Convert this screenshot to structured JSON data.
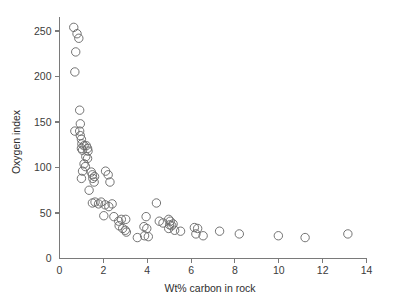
{
  "figure": {
    "background": "#ffffff",
    "marker_color": "#6b6b6b",
    "axis_color": "#7a7a7a",
    "text_color": "#2e2e2e"
  },
  "chart_data": {
    "type": "scatter",
    "title": "",
    "xlabel": "Wt% carbon in rock",
    "ylabel": "Oxygen index",
    "xlim": [
      0,
      14
    ],
    "ylim": [
      0,
      270
    ],
    "xticks": [
      0,
      2,
      4,
      6,
      8,
      10,
      12,
      14
    ],
    "xtick_labels": [
      "0",
      "2",
      "4",
      "6",
      "8",
      "10",
      "12",
      "14"
    ],
    "yticks": [
      0,
      50,
      100,
      150,
      200,
      250
    ],
    "ytick_labels": [
      "0",
      "50",
      "100",
      "150",
      "200",
      "250"
    ],
    "grid": false,
    "legend": null,
    "marker": "open-circle",
    "marker_size": 4.2,
    "series": [
      {
        "name": "samples",
        "points": [
          [
            0.65,
            254
          ],
          [
            0.8,
            247
          ],
          [
            0.88,
            242
          ],
          [
            0.74,
            227
          ],
          [
            0.7,
            205
          ],
          [
            0.92,
            163
          ],
          [
            0.7,
            140
          ],
          [
            0.95,
            148
          ],
          [
            0.92,
            140
          ],
          [
            0.95,
            135
          ],
          [
            1.0,
            131
          ],
          [
            1.02,
            126
          ],
          [
            1.0,
            121
          ],
          [
            1.05,
            119
          ],
          [
            1.12,
            124
          ],
          [
            1.22,
            124
          ],
          [
            1.28,
            121
          ],
          [
            1.3,
            118
          ],
          [
            1.2,
            112
          ],
          [
            1.28,
            110
          ],
          [
            1.12,
            104
          ],
          [
            1.18,
            101
          ],
          [
            1.05,
            96
          ],
          [
            1.0,
            88
          ],
          [
            1.45,
            95
          ],
          [
            1.5,
            92
          ],
          [
            1.52,
            88
          ],
          [
            1.6,
            90
          ],
          [
            1.58,
            84
          ],
          [
            1.35,
            75
          ],
          [
            2.1,
            96
          ],
          [
            2.22,
            92
          ],
          [
            2.3,
            84
          ],
          [
            1.5,
            61
          ],
          [
            1.62,
            62
          ],
          [
            1.78,
            60
          ],
          [
            1.9,
            62
          ],
          [
            2.08,
            59
          ],
          [
            2.25,
            57
          ],
          [
            2.4,
            60
          ],
          [
            2.02,
            47
          ],
          [
            2.48,
            46
          ],
          [
            2.7,
            41
          ],
          [
            2.82,
            43
          ],
          [
            3.02,
            43
          ],
          [
            2.72,
            36
          ],
          [
            2.88,
            33
          ],
          [
            3.0,
            31
          ],
          [
            3.05,
            29
          ],
          [
            3.55,
            23
          ],
          [
            3.95,
            46
          ],
          [
            3.85,
            35
          ],
          [
            3.98,
            33
          ],
          [
            3.88,
            25
          ],
          [
            4.05,
            24
          ],
          [
            4.42,
            61
          ],
          [
            4.55,
            41
          ],
          [
            4.72,
            39
          ],
          [
            4.98,
            43
          ],
          [
            5.05,
            41
          ],
          [
            5.02,
            37
          ],
          [
            5.12,
            36
          ],
          [
            5.18,
            38
          ],
          [
            4.98,
            33
          ],
          [
            5.25,
            31
          ],
          [
            5.52,
            30
          ],
          [
            6.15,
            34
          ],
          [
            6.3,
            33
          ],
          [
            6.22,
            27
          ],
          [
            6.55,
            25
          ],
          [
            7.3,
            30
          ],
          [
            8.2,
            27
          ],
          [
            9.98,
            25
          ],
          [
            11.2,
            23
          ],
          [
            13.15,
            27
          ]
        ]
      }
    ]
  },
  "axis_labels": {
    "x_title": "Wt% carbon in rock",
    "y_title": "Oxygen index"
  }
}
